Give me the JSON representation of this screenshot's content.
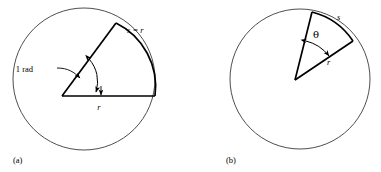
{
  "figure": {
    "background_color": "#ffffff",
    "stroke_color": "#000000",
    "circle_stroke_color": "#3a3a3a",
    "width": 381,
    "height": 172,
    "panels": [
      {
        "id": "a",
        "caption": "(a)",
        "circle": {
          "cx": 84,
          "cy": 79,
          "r": 71
        },
        "vertex": {
          "x": 62,
          "y": 96
        },
        "labels": {
          "angle_label": "1 rad",
          "arc_label": "s = r",
          "radius_label": "r"
        },
        "angle_degrees": 57.3,
        "description": "Circle with a central angle of one radian; the intercepted arc length s equals the radius r."
      },
      {
        "id": "b",
        "caption": "(b)",
        "circle": {
          "cx": 300,
          "cy": 79,
          "r": 70
        },
        "vertex": {
          "x": 295,
          "y": 80
        },
        "labels": {
          "angle_label": "θ",
          "arc_label": "s",
          "radius_label": "r"
        },
        "angle_degrees": 30,
        "description": "Circle with a general central angle theta subtending arc length s with radius r."
      }
    ]
  }
}
